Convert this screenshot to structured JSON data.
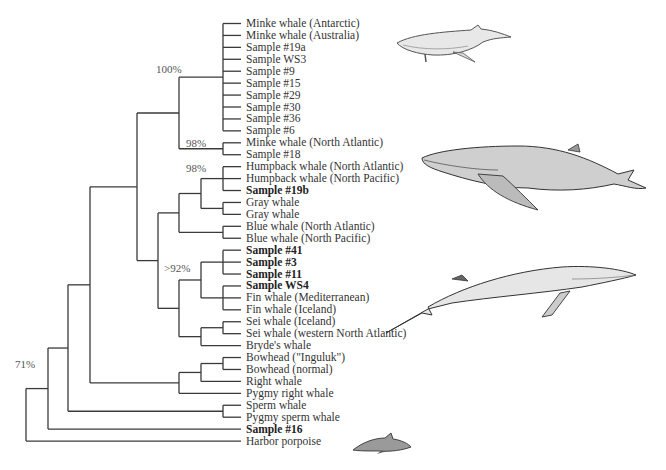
{
  "figure": {
    "type": "phylogenetic-tree",
    "leaf_start_y": 23.5,
    "leaf_spacing": 11.93,
    "leaf_tick_end_x": 241,
    "line_color": "#3a3a3a",
    "leaves": [
      {
        "label": "Minke whale (Antarctic)",
        "bold": false
      },
      {
        "label": "Minke whale (Australia)",
        "bold": false
      },
      {
        "label": "Sample #19a",
        "bold": false
      },
      {
        "label": "Sample WS3",
        "bold": false
      },
      {
        "label": "Sample #9",
        "bold": false
      },
      {
        "label": "Sample #15",
        "bold": false
      },
      {
        "label": "Sample #29",
        "bold": false
      },
      {
        "label": "Sample #30",
        "bold": false
      },
      {
        "label": "Sample #36",
        "bold": false
      },
      {
        "label": "Sample #6",
        "bold": false
      },
      {
        "label": "Minke whale (North Atlantic)",
        "bold": false
      },
      {
        "label": "Sample #18",
        "bold": false
      },
      {
        "label": "Humpback whale (North Atlantic)",
        "bold": false
      },
      {
        "label": "Humpback whale (North Pacific)",
        "bold": false
      },
      {
        "label": "Sample #19b",
        "bold": true
      },
      {
        "label": "Gray whale",
        "bold": false
      },
      {
        "label": "Gray whale",
        "bold": false
      },
      {
        "label": "Blue whale (North Atlantic)",
        "bold": false
      },
      {
        "label": "Blue whale (North Pacific)",
        "bold": false
      },
      {
        "label": "Sample #41",
        "bold": true
      },
      {
        "label": "Sample #3",
        "bold": true
      },
      {
        "label": "Sample #11",
        "bold": true
      },
      {
        "label": "Sample WS4",
        "bold": true
      },
      {
        "label": "Fin whale (Mediterranean)",
        "bold": false
      },
      {
        "label": "Fin whale (Iceland)",
        "bold": false
      },
      {
        "label": "Sei whale (Iceland)",
        "bold": false
      },
      {
        "label": "Sei whale (western North Atlantic)",
        "bold": false
      },
      {
        "label": "Bryde's whale",
        "bold": false
      },
      {
        "label": "Bowhead (\"Inguluk\")",
        "bold": false
      },
      {
        "label": "Bowhead (normal)",
        "bold": false
      },
      {
        "label": "Right whale",
        "bold": false
      },
      {
        "label": "Pygmy right whale",
        "bold": false
      },
      {
        "label": "Sperm whale",
        "bold": false
      },
      {
        "label": "Pygmy sperm whale",
        "bold": false
      },
      {
        "label": "Sample #16",
        "bold": true
      },
      {
        "label": "Harbor porpoise",
        "bold": false
      }
    ],
    "tree": {
      "x": 26,
      "children": [
        {
          "x": 48,
          "children": [
            {
              "x": 68,
              "children": [
                {
                  "x": 90,
                  "children": [
                    {
                      "x": 137,
                      "children": [
                        {
                          "x": 179,
                          "support": "98%",
                          "children": [
                            {
                              "x": 223,
                              "support": "100%",
                              "leaves": [
                                0,
                                1,
                                2,
                                3,
                                4,
                                5,
                                6,
                                7,
                                8,
                                9
                              ]
                            },
                            {
                              "x": 223,
                              "leaves": [
                                10,
                                11
                              ]
                            }
                          ]
                        },
                        {
                          "x": 158,
                          "children": [
                            {
                              "x": 179,
                              "children": [
                                {
                                  "x": 201,
                                  "support": "98%",
                                  "children": [
                                    {
                                      "x": 223,
                                      "leaves": [
                                        12,
                                        13,
                                        14
                                      ]
                                    },
                                    {
                                      "x": 223,
                                      "leaves": [
                                        15,
                                        16
                                      ]
                                    }
                                  ]
                                },
                                {
                                  "x": 223,
                                  "leaves": [
                                    17,
                                    18
                                  ]
                                }
                              ]
                            },
                            {
                              "x": 179,
                              "support": ">92%",
                              "children": [
                                {
                                  "x": 201,
                                  "children": [
                                    {
                                      "x": 223,
                                      "leaves": [
                                        19,
                                        20,
                                        21
                                      ]
                                    },
                                    {
                                      "x": 223,
                                      "leaves": [
                                        22,
                                        23,
                                        24
                                      ]
                                    }
                                  ]
                                },
                                {
                                  "x": 201,
                                  "children": [
                                    {
                                      "x": 223,
                                      "leaves": [
                                        25,
                                        26
                                      ]
                                    },
                                    {
                                      "leaf": 27
                                    }
                                  ]
                                }
                              ]
                            }
                          ]
                        }
                      ]
                    },
                    {
                      "x": 179,
                      "children": [
                        {
                          "x": 201,
                          "children": [
                            {
                              "x": 223,
                              "leaves": [
                                28,
                                29
                              ]
                            },
                            {
                              "leaf": 30
                            }
                          ]
                        },
                        {
                          "leaf": 31
                        }
                      ]
                    }
                  ]
                },
                {
                  "x": 223,
                  "leaves": [
                    32,
                    33
                  ]
                }
              ]
            },
            {
              "leaf": 34
            }
          ]
        },
        {
          "leaf": 35
        }
      ]
    },
    "support_labels": [
      {
        "text": "100%",
        "x": 156,
        "y": 63
      },
      {
        "text": "98%",
        "x": 186,
        "y": 137
      },
      {
        "text": "98%",
        "x": 186,
        "y": 162
      },
      {
        "text": ">92%",
        "x": 164,
        "y": 262
      },
      {
        "text": "71%",
        "x": 15,
        "y": 358
      }
    ],
    "illustrations": [
      {
        "name": "minke-whale",
        "x": 393,
        "y": 10,
        "w": 118,
        "h": 52
      },
      {
        "name": "humpback-whale",
        "x": 418,
        "y": 140,
        "w": 236,
        "h": 70
      },
      {
        "name": "fin-whale",
        "x": 382,
        "y": 245,
        "w": 256,
        "h": 92
      },
      {
        "name": "harbor-porpoise",
        "x": 351,
        "y": 430,
        "w": 60,
        "h": 22
      }
    ]
  }
}
